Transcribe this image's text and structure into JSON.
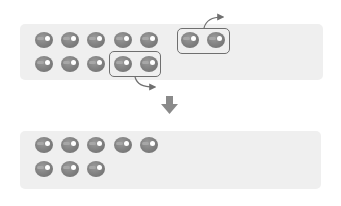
{
  "diagram": {
    "top_panel": {
      "row1_count": 5,
      "row2_count": 5,
      "extra_group_count": 2,
      "highlighted_group_row2_count": 2
    },
    "bottom_panel": {
      "row1_count": 5,
      "row2_count": 3
    },
    "icons": [
      "ball-icon",
      "curved-arrow-icon",
      "down-arrow-icon"
    ],
    "colors": {
      "panel": "#efefef",
      "ball": "#808080",
      "outline": "#6f6f6f",
      "arrow": "#8a8a8a"
    }
  }
}
